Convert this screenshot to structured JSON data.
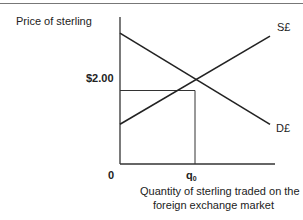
{
  "chart_data": {
    "type": "line",
    "title": "",
    "ylabel": "Price of sterling",
    "xlabel": "Quantity of sterling traded on the foreign exchange market",
    "xlabel_lines": [
      "Quantity of sterling traded on the",
      "foreign exchange market"
    ],
    "origin_label": "0",
    "equilibrium": {
      "price_label": "$2.00",
      "quantity_label": "q",
      "quantity_subscript": "0",
      "x": 0.5,
      "y": 0.5
    },
    "xlim": [
      0,
      1
    ],
    "ylim": [
      0,
      1
    ],
    "series": [
      {
        "name": "S£",
        "kind": "supply",
        "x": [
          0,
          1
        ],
        "y": [
          0.27,
          0.87
        ]
      },
      {
        "name": "D£",
        "kind": "demand",
        "x": [
          0,
          1
        ],
        "y": [
          0.89,
          0.27
        ]
      }
    ],
    "colors": {
      "line": "#222222",
      "axis": "#333333",
      "rule": "#777777"
    }
  }
}
